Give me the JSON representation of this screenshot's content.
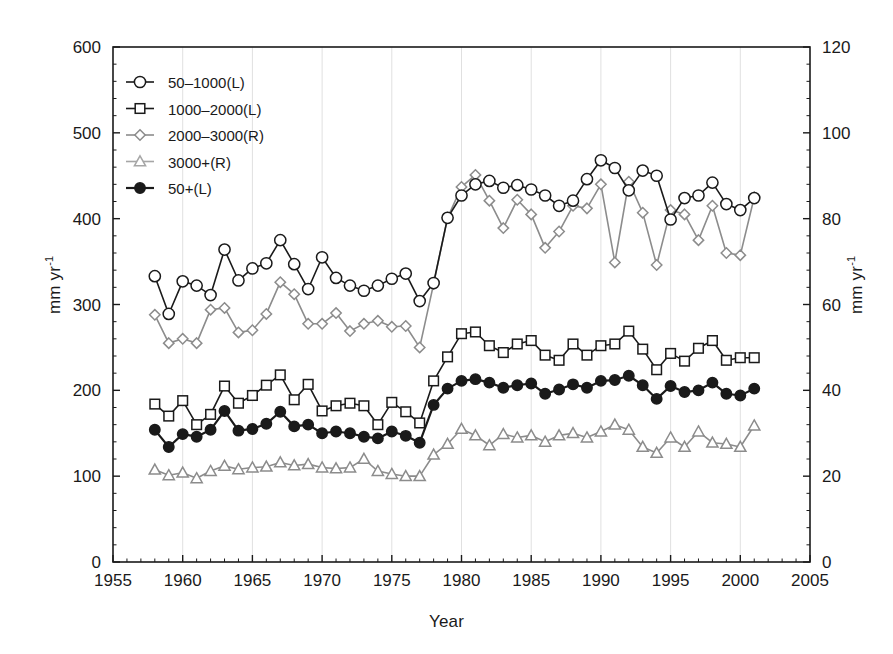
{
  "chart_data": {
    "type": "line",
    "title": "",
    "subtitle": "",
    "xlabel": "Year",
    "ylabel": "mm yr-1",
    "ylabel_right": "mm yr-1",
    "ylabel_display": "mm yr",
    "ylabel_sup": "-1",
    "xlim": [
      1955,
      2005
    ],
    "ylim": [
      0,
      600
    ],
    "ylim_right": [
      0,
      120
    ],
    "xticks": [
      1955,
      1960,
      1965,
      1970,
      1975,
      1980,
      1985,
      1990,
      1995,
      2000,
      2005
    ],
    "yticks_left": [
      0,
      100,
      200,
      300,
      400,
      500,
      600
    ],
    "yticks_right": [
      0,
      20,
      40,
      60,
      80,
      100,
      120
    ],
    "x_minor_interval": 1,
    "y_minor_interval_left": 20,
    "y_minor_interval_right": 4,
    "grid": "vertical-only-at-major-xticks",
    "legend_position": "top-left-inside",
    "x": [
      1958,
      1959,
      1960,
      1961,
      1962,
      1963,
      1964,
      1965,
      1966,
      1967,
      1968,
      1969,
      1970,
      1971,
      1972,
      1973,
      1974,
      1975,
      1976,
      1977,
      1978,
      1979,
      1980,
      1981,
      1982,
      1983,
      1984,
      1985,
      1986,
      1987,
      1988,
      1989,
      1990,
      1991,
      1992,
      1993,
      1994,
      1995,
      1996,
      1997,
      1998,
      1999,
      2000,
      2001
    ],
    "series": [
      {
        "name": "50-1000(L)",
        "axis": "left",
        "marker": "open-circle",
        "color": "#1a1a1a",
        "values": [
          333,
          289,
          327,
          322,
          311,
          364,
          328,
          342,
          348,
          375,
          347,
          318,
          355,
          331,
          322,
          316,
          322,
          330,
          336,
          304,
          325,
          401,
          427,
          440,
          444,
          436,
          439,
          434,
          427,
          415,
          421,
          446,
          468,
          459,
          433,
          456,
          450,
          399,
          424,
          427,
          442,
          417,
          410,
          424
        ]
      },
      {
        "name": "1000-2000(L)",
        "axis": "left",
        "marker": "open-square",
        "color": "#1a1a1a",
        "values": [
          184,
          170,
          188,
          160,
          172,
          205,
          185,
          194,
          206,
          218,
          189,
          207,
          176,
          182,
          185,
          182,
          160,
          186,
          175,
          162,
          211,
          239,
          266,
          268,
          252,
          244,
          254,
          258,
          241,
          235,
          254,
          241,
          252,
          254,
          269,
          248,
          224,
          243,
          234,
          249,
          258,
          235,
          238,
          238
        ]
      },
      {
        "name": "2000-3000(R)",
        "axis": "right",
        "marker": "open-diamond",
        "color": "#8c8c8c",
        "values": [
          57.6,
          51.0,
          52.0,
          51.0,
          58.8,
          59.2,
          53.5,
          54.0,
          57.8,
          65.2,
          62.4,
          55.5,
          55.5,
          58.0,
          53.8,
          55.5,
          56.2,
          54.8,
          55.0,
          50.0,
          64.8,
          80.2,
          87.4,
          90.2,
          84.2,
          77.8,
          84.4,
          81.0,
          73.2,
          77.0,
          83.0,
          82.4,
          88.0,
          69.8,
          88.6,
          81.4,
          69.2,
          82.0,
          81.0,
          75.0,
          83.0,
          72.0,
          71.5,
          85.0
        ]
      },
      {
        "name": "3000+(R)",
        "axis": "right",
        "marker": "open-triangle",
        "color": "#8c8c8c",
        "values": [
          21.5,
          20.2,
          20.8,
          19.5,
          21.2,
          22.4,
          21.6,
          22.0,
          22.2,
          23.2,
          22.5,
          22.8,
          22.0,
          21.8,
          22.0,
          24.0,
          21.2,
          20.5,
          20.0,
          20.0,
          25.0,
          27.5,
          31.0,
          29.5,
          27.2,
          29.8,
          29.0,
          29.5,
          28.0,
          29.5,
          30.0,
          29.0,
          30.4,
          32.0,
          30.8,
          26.8,
          25.4,
          29.0,
          26.8,
          30.4,
          27.8,
          27.5,
          26.8,
          31.8
        ]
      },
      {
        "name": "50+(L)",
        "axis": "left",
        "marker": "filled-circle",
        "color": "#1a1a1a",
        "values": [
          154,
          134,
          149,
          146,
          154,
          176,
          153,
          155,
          161,
          175,
          158,
          160,
          150,
          152,
          150,
          146,
          144,
          152,
          147,
          139,
          183,
          202,
          211,
          213,
          209,
          203,
          206,
          208,
          196,
          201,
          207,
          203,
          211,
          212,
          217,
          206,
          190,
          205,
          198,
          200,
          209,
          196,
          194,
          202
        ]
      }
    ]
  },
  "legend": {
    "entries": [
      {
        "label": "50–1000(L)",
        "marker": "open-circle",
        "color": "#1a1a1a"
      },
      {
        "label": "1000–2000(L)",
        "marker": "open-square",
        "color": "#1a1a1a"
      },
      {
        "label": "2000–3000(R)",
        "marker": "open-diamond",
        "color": "#8c8c8c"
      },
      {
        "label": "3000+(R)",
        "marker": "open-triangle",
        "color": "#a6a6a6"
      },
      {
        "label": "50+(L)",
        "marker": "filled-circle",
        "color": "#1a1a1a"
      }
    ]
  },
  "colors": {
    "axis": "#1a1a1a",
    "grid": "#e0e0e0",
    "dark_series": "#1a1a1a",
    "grey_series": "#8c8c8c",
    "light_grey_series": "#a6a6a6",
    "background": "#ffffff"
  }
}
